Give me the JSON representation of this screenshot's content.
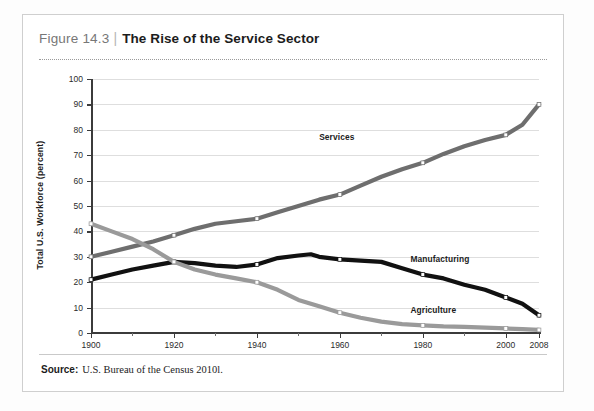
{
  "figure": {
    "label": "Figure 14.3",
    "separator": "|",
    "title": "The Rise of the Service Sector"
  },
  "source": {
    "prefix": "Source:",
    "text": "U.S. Bureau of the Census 2010l."
  },
  "colors": {
    "services": "#6e6e6e",
    "manufacturing": "#111111",
    "agriculture": "#9a9a9a",
    "grid": "#dedede",
    "axis": "#3b3b3b",
    "frame": "#cfcfcf"
  },
  "chart_data": {
    "type": "line",
    "title": "The Rise of the Service Sector",
    "xlabel": "",
    "ylabel": "Total U.S. Workforce (percent)",
    "xlim": [
      1900,
      2008
    ],
    "ylim": [
      0,
      100
    ],
    "grid": true,
    "legend": "inline-labels",
    "ytick_labels": [
      "0",
      "10",
      "20",
      "30",
      "40",
      "50",
      "60",
      "70",
      "80",
      "90",
      "100"
    ],
    "ytick_values": [
      0,
      10,
      20,
      30,
      40,
      50,
      60,
      70,
      80,
      90,
      100
    ],
    "xtick_labels": [
      "1900",
      "1920",
      "1940",
      "1960",
      "1980",
      "2000",
      "2008"
    ],
    "xtick_values": [
      1900,
      1920,
      1940,
      1960,
      1980,
      2000,
      2008
    ],
    "x": [
      1900,
      1905,
      1910,
      1915,
      1920,
      1925,
      1930,
      1935,
      1940,
      1945,
      1950,
      1953,
      1955,
      1960,
      1965,
      1970,
      1975,
      1980,
      1985,
      1990,
      1995,
      2000,
      2004,
      2008
    ],
    "series": [
      {
        "name": "Services",
        "color": "#6e6e6e",
        "markers_at": [
          1900,
          1920,
          1940,
          1960,
          1980,
          2000,
          2008
        ],
        "values": [
          30,
          32,
          34,
          36,
          38.5,
          41,
          43,
          44,
          45,
          47.5,
          50,
          51.5,
          52.5,
          54.5,
          58,
          61.5,
          64.5,
          67,
          70.5,
          73.5,
          76,
          78,
          82,
          90
        ]
      },
      {
        "name": "Manufacturing",
        "color": "#111111",
        "markers_at": [
          1900,
          1920,
          1940,
          1960,
          1980,
          2000,
          2008
        ],
        "values": [
          21,
          23,
          25,
          26.5,
          28,
          27.5,
          26.5,
          26,
          27,
          29.5,
          30.5,
          31,
          30,
          29,
          28.5,
          28,
          25.5,
          23,
          21.5,
          19,
          17,
          14,
          11.5,
          7
        ]
      },
      {
        "name": "Agriculture",
        "color": "#9a9a9a",
        "markers_at": [
          1900,
          1920,
          1940,
          1960,
          1980,
          2000,
          2008
        ],
        "values": [
          43,
          40,
          37,
          33,
          28,
          25,
          23,
          21.5,
          20,
          17,
          13,
          11.5,
          10.5,
          8,
          6,
          4.5,
          3.5,
          3,
          2.6,
          2.4,
          2.1,
          1.8,
          1.5,
          1.2
        ]
      }
    ],
    "annotations": [
      {
        "text": "Services",
        "x": 1955,
        "y": 77
      },
      {
        "text": "Manufacturing",
        "x": 1977,
        "y": 29
      },
      {
        "text": "Agriculture",
        "x": 1977,
        "y": 9
      }
    ]
  }
}
